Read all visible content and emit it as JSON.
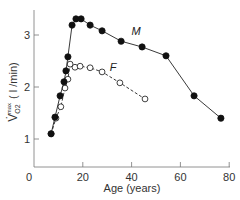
{
  "chart_data": {
    "type": "line",
    "title": "",
    "xlabel": "Age (years)",
    "ylabel": "V̇O2 max (l/min)",
    "ylabel_parts": {
      "v": "V̇",
      "sub": "O2",
      "sup": "max",
      "unit": "( l /min)"
    },
    "xlim": [
      0,
      80
    ],
    "ylim": [
      0.45,
      3.5
    ],
    "xticks": [
      0,
      20,
      40,
      60,
      80
    ],
    "yticks": [
      1,
      2,
      3
    ],
    "grid": false,
    "legend": "inline labels",
    "series": [
      {
        "name": "M",
        "marker": "filled-circle",
        "line": "solid",
        "x": [
          7,
          8.6,
          10.7,
          12.3,
          13.1,
          13.9,
          15.6,
          17.2,
          19.3,
          23,
          27.9,
          35.7,
          44.3,
          54.1,
          65.6,
          76.6
        ],
        "y": [
          1.1,
          1.42,
          1.83,
          2.1,
          2.31,
          2.58,
          3.19,
          3.31,
          3.31,
          3.19,
          3.08,
          2.88,
          2.77,
          2.6,
          1.83,
          1.4
        ]
      },
      {
        "name": "F",
        "marker": "open-circle",
        "line": "dashed",
        "x": [
          7,
          9,
          11,
          12.7,
          13.9,
          14.8,
          16.8,
          18.9,
          23,
          27.9,
          35.2,
          45.5
        ],
        "y": [
          1.1,
          1.4,
          1.62,
          1.98,
          2.15,
          2.44,
          2.38,
          2.4,
          2.37,
          2.29,
          2.08,
          1.77
        ]
      }
    ],
    "annotations": [
      {
        "text": "M",
        "x": 40,
        "y": 3.0
      },
      {
        "text": "F",
        "x": 31,
        "y": 2.3
      }
    ]
  }
}
